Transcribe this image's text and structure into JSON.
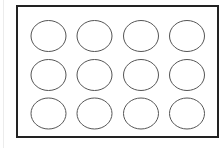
{
  "diagram": {
    "type": "grid-of-ellipses",
    "canvas": {
      "width": 224,
      "height": 148,
      "background": "#ffffff"
    },
    "page_edge": {
      "x": 3,
      "color": "#ececec"
    },
    "frame": {
      "x": 17,
      "y": 6,
      "width": 201,
      "height": 131,
      "stroke": "#222222",
      "stroke_width": 2,
      "fill": "#ffffff"
    },
    "grid": {
      "rows": 3,
      "cols": 4,
      "col_centers": [
        48.5,
        94.5,
        141,
        187
      ],
      "row_centers": [
        36,
        75,
        113.5
      ],
      "ellipse": {
        "rx": 17.5,
        "ry": 15.5,
        "stroke": "#555555",
        "stroke_width": 1,
        "fill": "none"
      }
    },
    "ellipses": [
      {
        "row": 1,
        "col": 1
      },
      {
        "row": 1,
        "col": 2
      },
      {
        "row": 1,
        "col": 3
      },
      {
        "row": 1,
        "col": 4
      },
      {
        "row": 2,
        "col": 1
      },
      {
        "row": 2,
        "col": 2
      },
      {
        "row": 2,
        "col": 3
      },
      {
        "row": 2,
        "col": 4
      },
      {
        "row": 3,
        "col": 1
      },
      {
        "row": 3,
        "col": 2
      },
      {
        "row": 3,
        "col": 3
      },
      {
        "row": 3,
        "col": 4
      }
    ]
  }
}
